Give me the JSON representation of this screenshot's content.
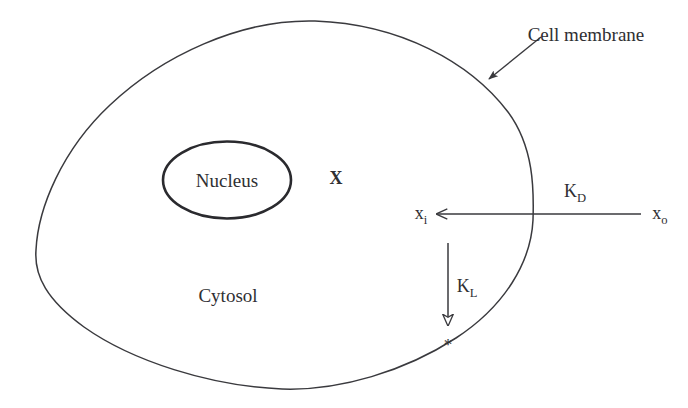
{
  "figure": {
    "stroke_color": "#3a3a3e",
    "text_color": "#2f2f33",
    "background_color": "#ffffff"
  },
  "labels": {
    "cell_membrane": "Cell membrane",
    "nucleus": "Nucleus",
    "cytosol": "Cytosol",
    "species_x": "X",
    "x_inside_base": "x",
    "x_inside_sub": "i",
    "x_outside_base": "x",
    "x_outside_sub": "o",
    "rate_diffusion_base": "K",
    "rate_diffusion_sub": "D",
    "rate_loss_base": "K",
    "rate_loss_sub": "L",
    "metabolite_marker": "*"
  },
  "elements": {
    "cell_outline_name": "cell-membrane-outline",
    "nucleus_outline_name": "nucleus-outline",
    "membrane_pointer_name": "cell-membrane-leader-arrow",
    "influx_arrow_name": "influx-arrow",
    "loss_arrow_name": "loss-arrow"
  }
}
